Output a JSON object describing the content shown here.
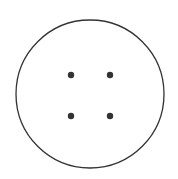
{
  "figure": {
    "background": "#ffffff",
    "stroke_color": "#333333",
    "circle": {
      "cx": 90,
      "cy": 94,
      "r": 74,
      "stroke_width": 1.3
    },
    "holes": [
      {
        "cx": 71,
        "cy": 75,
        "r": 3.2
      },
      {
        "cx": 110,
        "cy": 75,
        "r": 3.2
      },
      {
        "cx": 71,
        "cy": 116,
        "r": 3.2
      },
      {
        "cx": 110,
        "cy": 116,
        "r": 3.2
      }
    ]
  }
}
